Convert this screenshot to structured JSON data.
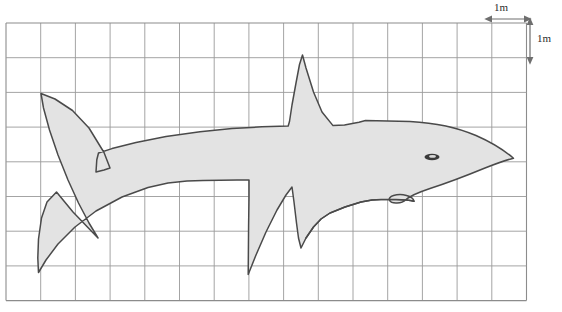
{
  "figure": {
    "title_alt": "Shark drawn on a metric grid",
    "colors": {
      "background": "#ffffff",
      "grid_line": "#9a9a9a",
      "grid_border": "#8c8c8c",
      "shape_fill": "#e3e3e3",
      "shape_outline": "#4a4a4a",
      "eye_fill": "#3a3a3a",
      "label_text": "#2b2b2b",
      "arrow": "#6e6e6e"
    },
    "grid": {
      "x": 6,
      "y": 23,
      "cell_size": 34.7,
      "columns": 15,
      "rows": 8,
      "width": 520,
      "height": 282,
      "show_border": true
    },
    "scale": {
      "horizontal_label": "1m",
      "vertical_label": "1m",
      "unit": "m",
      "cell_value": 1
    },
    "shark": {
      "label": "shark-silhouette",
      "eye": {
        "cx": 432,
        "cy": 157,
        "rx": 7.5,
        "ry": 3.2
      },
      "eye_highlight": {
        "cx": 432.5,
        "cy": 156.4,
        "rx": 3.4,
        "ry": 1.3
      },
      "body_path": "M 513.5 158.2 C 505 151 492 142.5 476 135.5 C 458 127.6 436 122.8 410 121.4 L 365.5 120.6 L 359 122.2 L 344.5 125.0 L 333.0 125.6 L 322.0 112.0 L 313.5 92.0 L 306.0 68.0 L 302.5 55.0 L 299.5 64.5 L 296.0 83.0 L 292.0 105.0 L 289.5 121.5 L 288.2 126.0 L 262 126.8 L 232 128.6 L 200 131.8 L 166 136.6 L 136 142.5 L 112 148.6 L 98.5 153.0 L 96.8 159.8 L 96.0 172.0 L 104.0 170.0 L 110.0 168.0 L 104.0 152.5 L 89.0 128.0 L 72.5 110.5 L 55.0 99.0 L 41.0 93.5 L 43.5 108.0 L 49.5 130.0 L 58.0 155.0 L 68.0 180.0 L 78.5 203.0 L 89.0 223.0 L 98.0 238.0 L 73.0 212.0 L 56.5 192.0 L 47.0 202.0 L 41.5 218.0 L 38.5 239.0 L 37.8 258.0 L 38.5 272.5 L 46.0 260.0 L 58.0 244.0 L 75.0 227.0 L 96.0 211.0 L 122.0 197.0 L 148.0 187.5 L 168.0 183.0 L 187.0 181.0 L 203.0 180.4 L 237.0 180.0 L 249.0 180.0 L 249.0 198.0 L 248.6 226.0 L 248.2 274.5 L 256.0 255.0 L 266.0 232.0 L 277.0 210.0 L 286.0 195.0 L 292.0 187.0 L 294.0 202.0 L 296.5 223.0 L 298.5 238.0 L 301.0 248.0 L 306.0 238.0 L 313.5 227.0 L 321.0 219.0 L 330.0 213.0 L 345.0 207.0 L 361.0 202.0 L 372.0 200.0 L 381.0 199.6 L 396.0 199.6 C 404 199.6 410 200.2 414 201.2 C 413.5 198.5 411.0 196.5 406.5 195.4 C 402 194.3 397 194.5 393.5 195.5 C 390 196.6 388.5 198.6 389.5 200.4 C 390.5 202.2 393.5 203.2 397.0 203.0 C 401 202.8 404 201.6 405.5 200.0 C 409 196.5 418 192.5 430 188.5 C 447 183 468 175 485 168 C 499 162.5 508 159.5 513.5 158.2 Z",
      "mouth_path": "M 414 201.2 C 410 200.2 404 199.6 396 199.6 L 381 199.6 L 372 200.0 L 361 202.0 L 345 207.0 L 330 213.0 L 321 219.0 L 313.5 227.0 L 306 238.0"
    },
    "annotations": {
      "width_arrow": {
        "x1": 491,
        "x2": 525,
        "y": 19
      },
      "height_arrow": {
        "x": 530,
        "y1": 24,
        "y2": 58
      }
    }
  }
}
